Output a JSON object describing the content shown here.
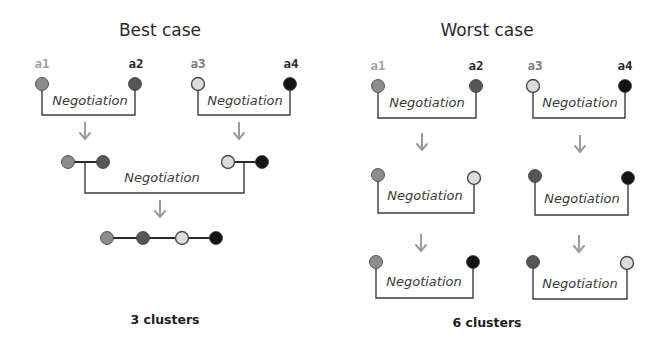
{
  "colors": {
    "a1": "#8c8c8c",
    "a2": "#565656",
    "a3": "#dcdcdc",
    "a4": "#141414",
    "label_a1": "#a0a0a0",
    "label_a2": "#2a2a2a",
    "label_a3": "#7a7a7a",
    "label_a4": "#2a2a2a",
    "arrow": "#9a9a9a",
    "outline_light": "#4a4a4a"
  },
  "best_case": {
    "title": "Best case",
    "agent_labels": [
      {
        "id": "a1",
        "text": "a1"
      },
      {
        "id": "a2",
        "text": "a2"
      },
      {
        "id": "a3",
        "text": "a3"
      },
      {
        "id": "a4",
        "text": "a4"
      }
    ],
    "step1": [
      {
        "left": "a1",
        "right": "a2",
        "label": "Negotiation"
      },
      {
        "left": "a3",
        "right": "a4",
        "label": "Negotiation"
      }
    ],
    "step2": {
      "left_cluster": [
        "a1",
        "a2"
      ],
      "right_cluster": [
        "a3",
        "a4"
      ],
      "label": "Negotiation"
    },
    "result_cluster": [
      "a1",
      "a2",
      "a3",
      "a4"
    ],
    "cluster_count_label": "3 clusters"
  },
  "worst_case": {
    "title": "Worst case",
    "agent_labels": [
      {
        "id": "a1",
        "text": "a1"
      },
      {
        "id": "a2",
        "text": "a2"
      },
      {
        "id": "a3",
        "text": "a3"
      },
      {
        "id": "a4",
        "text": "a4"
      }
    ],
    "rounds": [
      [
        {
          "left": "a1",
          "right": "a2",
          "label": "Negotiation"
        },
        {
          "left": "a3",
          "right": "a4",
          "label": "Negotiation"
        }
      ],
      [
        {
          "left": "a1",
          "right": "a3",
          "label": "Negotiation"
        },
        {
          "left": "a2",
          "right": "a4",
          "label": "Negotiation"
        }
      ],
      [
        {
          "left": "a1",
          "right": "a4",
          "label": "Negotiation"
        },
        {
          "left": "a2",
          "right": "a3",
          "label": "Negotiation"
        }
      ]
    ],
    "cluster_count_label": "6 clusters"
  }
}
